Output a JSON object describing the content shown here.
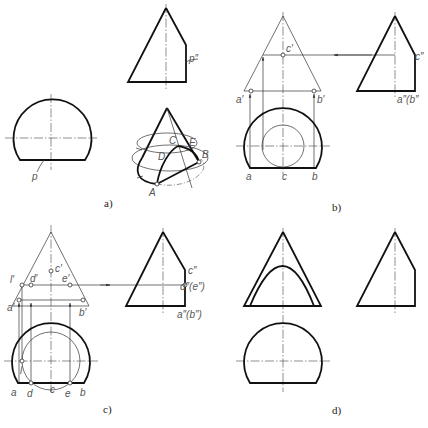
{
  "figure": {
    "panels": [
      {
        "id": "a",
        "caption": "a)",
        "labels": {
          "p_double_prime": "p″",
          "p": "p",
          "A": "A",
          "B": "B",
          "C": "C",
          "D": "D",
          "E": "E"
        }
      },
      {
        "id": "b",
        "caption": "b)",
        "labels": {
          "c_prime": "c′",
          "a_prime": "a′",
          "b_prime": "b′",
          "c_double_prime": "c″",
          "ab_double_prime": "a″(b″",
          "a": "a",
          "c": "c",
          "b": "b"
        }
      },
      {
        "id": "c",
        "caption": "c)",
        "labels": {
          "c_prime": "c′",
          "l_prime": "l′",
          "d_prime": "d′",
          "e_prime": "e′",
          "a_prime": "a′",
          "b_prime": "b′",
          "c_double_prime": "c″",
          "de_double_prime": "d″(e″)",
          "ab_double_prime": "a″(b″)",
          "l": "l",
          "a": "a",
          "d": "d",
          "c": "c",
          "e": "e",
          "b": "b"
        }
      },
      {
        "id": "d",
        "caption": "d)"
      }
    ]
  }
}
